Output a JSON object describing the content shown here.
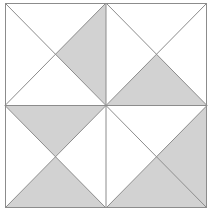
{
  "figure": {
    "type": "geometric-diagram",
    "canvas": {
      "width": 211,
      "height": 215
    },
    "colors": {
      "background": "#ffffff",
      "shaded_fill": "#d2d2d2",
      "unshaded_fill": "#ffffff",
      "stroke": "#8c8c8c",
      "outer_border": "#8c8c8c"
    },
    "geometry": {
      "outer_square": {
        "x": 5,
        "y": 3,
        "width": 202,
        "height": 205
      },
      "grid_rows": 2,
      "grid_cols": 2,
      "center_x": 106,
      "center_y": 105.5,
      "cell_width": 101,
      "cell_height": 102.5,
      "stroke_width": 1
    },
    "shaded_count": 6,
    "unshaded_count": 10,
    "total_triangles": 16,
    "quadrants": [
      {
        "id": "top-left",
        "name": "quadrant-top-left",
        "row": 0,
        "col": 0,
        "triangles": [
          {
            "position": "north",
            "shaded": false
          },
          {
            "position": "east",
            "shaded": true
          },
          {
            "position": "south",
            "shaded": false
          },
          {
            "position": "west",
            "shaded": false
          }
        ]
      },
      {
        "id": "top-right",
        "name": "quadrant-top-right",
        "row": 0,
        "col": 1,
        "triangles": [
          {
            "position": "north",
            "shaded": false
          },
          {
            "position": "east",
            "shaded": false
          },
          {
            "position": "south",
            "shaded": true
          },
          {
            "position": "west",
            "shaded": false
          }
        ]
      },
      {
        "id": "bottom-left",
        "name": "quadrant-bottom-left",
        "row": 1,
        "col": 0,
        "triangles": [
          {
            "position": "north",
            "shaded": true
          },
          {
            "position": "east",
            "shaded": false
          },
          {
            "position": "south",
            "shaded": true
          },
          {
            "position": "west",
            "shaded": false
          }
        ]
      },
      {
        "id": "bottom-right",
        "name": "quadrant-bottom-right",
        "row": 1,
        "col": 1,
        "triangles": [
          {
            "position": "north",
            "shaded": false
          },
          {
            "position": "east",
            "shaded": true
          },
          {
            "position": "south",
            "shaded": true
          },
          {
            "position": "west",
            "shaded": false
          }
        ]
      }
    ]
  }
}
